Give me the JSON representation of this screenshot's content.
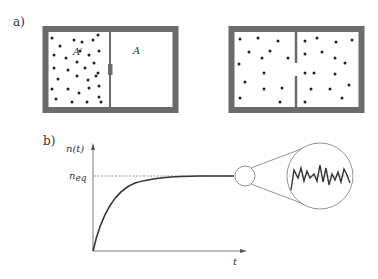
{
  "panel_a": {
    "label": "a)",
    "left_box": {
      "region_label_left": "A′",
      "region_label_right": "A",
      "partition": "closed wall with valve",
      "particles_left": [
        [
          52,
          38
        ],
        [
          60,
          46
        ],
        [
          74,
          40
        ],
        [
          82,
          42
        ],
        [
          93,
          40
        ],
        [
          98,
          35
        ],
        [
          54,
          55
        ],
        [
          66,
          58
        ],
        [
          80,
          51
        ],
        [
          89,
          55
        ],
        [
          99,
          51
        ],
        [
          54,
          68
        ],
        [
          68,
          70
        ],
        [
          77,
          62
        ],
        [
          85,
          68
        ],
        [
          94,
          63
        ],
        [
          98,
          73
        ],
        [
          58,
          79
        ],
        [
          77,
          76
        ],
        [
          88,
          80
        ],
        [
          96,
          76
        ],
        [
          52,
          89
        ],
        [
          68,
          89
        ],
        [
          79,
          93
        ],
        [
          89,
          88
        ],
        [
          99,
          86
        ],
        [
          56,
          99
        ],
        [
          72,
          102
        ],
        [
          87,
          102
        ],
        [
          99,
          97
        ],
        [
          101,
          102
        ]
      ]
    },
    "right_box": {
      "partition": "wall with opening",
      "particles": [
        [
          240,
          39
        ],
        [
          258,
          38
        ],
        [
          278,
          41
        ],
        [
          249,
          52
        ],
        [
          270,
          51
        ],
        [
          262,
          58
        ],
        [
          288,
          58
        ],
        [
          239,
          64
        ],
        [
          264,
          73
        ],
        [
          245,
          82
        ],
        [
          264,
          89
        ],
        [
          282,
          88
        ],
        [
          240,
          98
        ],
        [
          280,
          102
        ],
        [
          305,
          41
        ],
        [
          317,
          38
        ],
        [
          336,
          42
        ],
        [
          352,
          40
        ],
        [
          305,
          54
        ],
        [
          322,
          52
        ],
        [
          335,
          58
        ],
        [
          345,
          63
        ],
        [
          305,
          73
        ],
        [
          314,
          73
        ],
        [
          335,
          74
        ],
        [
          311,
          89
        ],
        [
          330,
          89
        ],
        [
          349,
          85
        ],
        [
          342,
          98
        ],
        [
          305,
          102
        ]
      ]
    }
  },
  "panel_b": {
    "label": "b)",
    "y_axis_label": "n(t)",
    "x_axis_label": "t",
    "equilibrium_label": "n",
    "equilibrium_subscript": "eq",
    "zoom_inset": "fluctuations around equilibrium"
  },
  "chart_data": {
    "type": "line",
    "title": "",
    "xlabel": "t",
    "ylabel": "n(t)",
    "annotations": [
      "n_eq (dashed equilibrium line)",
      "magnified circle showing fluctuations around n_eq"
    ],
    "series": [
      {
        "name": "n(t)",
        "x": [
          0,
          0.1,
          0.2,
          0.3,
          0.4,
          0.5,
          0.6,
          0.7,
          0.8,
          1.0
        ],
        "values": [
          0,
          0.45,
          0.7,
          0.84,
          0.92,
          0.96,
          0.98,
          0.99,
          1.0,
          1.0
        ]
      }
    ],
    "grid": false,
    "legend": "none"
  },
  "colors": {
    "wall": "#6b6b6b",
    "particle": "#222222",
    "line": "#333333",
    "axis": "#555555"
  }
}
